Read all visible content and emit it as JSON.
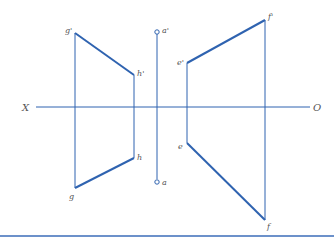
{
  "diagram": {
    "colors": {
      "line": "#2f63b0",
      "label": "#555555",
      "rule": "#3b6db8"
    },
    "axis": {
      "left_label": "X",
      "right_label": "O"
    },
    "points": {
      "g_prime": "g'",
      "h_prime": "h'",
      "g": "g",
      "h": "h",
      "a_prime": "a'",
      "a": "a",
      "e_prime": "e'",
      "f_prime": "f'",
      "e": "e",
      "f": "f"
    }
  }
}
